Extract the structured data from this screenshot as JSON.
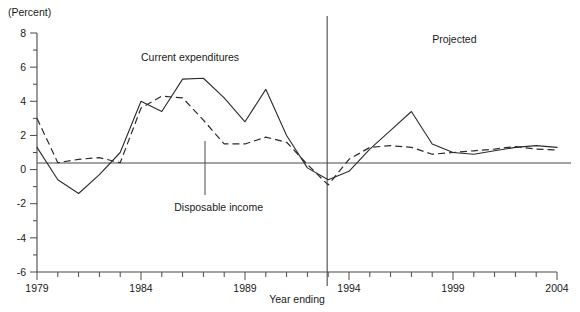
{
  "chart_data": {
    "type": "line",
    "title": "",
    "subtitle": "",
    "unit_label": "(Percent)",
    "xlabel": "Year ending",
    "ylabel": "",
    "ylim": [
      -6,
      8
    ],
    "xlim": [
      1979,
      2004
    ],
    "grid": false,
    "legend_position": "inline-annotations",
    "y_ticks": [
      8,
      6,
      4,
      2,
      0,
      -2,
      -4,
      -6
    ],
    "y_tick_labels": [
      "8",
      "6",
      "4",
      "2",
      "0",
      "-2",
      "-4",
      "-6"
    ],
    "y_minor_tick_step": 1,
    "x_tick_labels": [
      "1979",
      "1984",
      "1989",
      "1994",
      "1999",
      "2004"
    ],
    "x_tick_label_years": [
      1979,
      1984,
      1989,
      1994,
      1999,
      2004
    ],
    "x_minor_tick_step": 1,
    "annotations": [
      {
        "name": "projected-label",
        "text": "Projected",
        "x_year": 1998.0,
        "y_value": 7.4
      },
      {
        "name": "current-expenditures-label",
        "text": "Current expenditures",
        "x_year": 1984.0,
        "y_value": 6.35
      },
      {
        "name": "disposable-income-label",
        "text": "Disposable income",
        "x_year": 1985.6,
        "y_value": -2.4
      }
    ],
    "divider": {
      "name": "projection-divider",
      "x_year": 1992.95,
      "label": "Projected"
    },
    "x": [
      1979,
      1980,
      1981,
      1982,
      1983,
      1984,
      1985,
      1986,
      1987,
      1988,
      1989,
      1990,
      1991,
      1992,
      1993,
      1994,
      1995,
      1996,
      1997,
      1998,
      1999,
      2000,
      2001,
      2002,
      2003,
      2004
    ],
    "series": [
      {
        "name": "Current expenditures",
        "style": "solid",
        "values": [
          1.3,
          -0.6,
          -1.4,
          -0.3,
          1.0,
          4.0,
          3.4,
          5.3,
          5.35,
          4.2,
          2.8,
          4.7,
          2.0,
          0.1,
          -0.6,
          -0.1,
          1.2,
          2.3,
          3.4,
          1.5,
          1.0,
          0.9,
          1.1,
          1.3,
          1.4,
          1.3
        ]
      },
      {
        "name": "Disposable income",
        "style": "dashed",
        "values": [
          3.0,
          0.4,
          0.6,
          0.7,
          0.4,
          3.6,
          4.3,
          4.2,
          2.9,
          1.5,
          1.5,
          1.9,
          1.6,
          0.3,
          -0.9,
          0.6,
          1.3,
          1.4,
          1.3,
          0.9,
          1.0,
          1.1,
          1.2,
          1.35,
          1.2,
          1.15
        ]
      }
    ]
  },
  "colors": {
    "axis": "#4a4a4a",
    "series": "#2b2b2b",
    "background": "#ffffff"
  }
}
